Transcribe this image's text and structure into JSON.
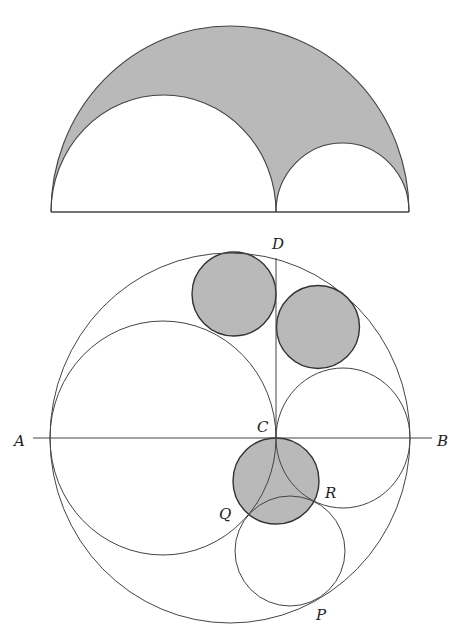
{
  "figure_top": {
    "title": "Arbelos",
    "shade_color": "#b9b9b9",
    "stroke_color": "#444444"
  },
  "figure_bottom": {
    "title": "Arbelos with Archimedean twin circles and Bankoff circle",
    "labels": {
      "A": "A",
      "B": "B",
      "C": "C",
      "D": "D",
      "P": "P",
      "Q": "Q",
      "R": "R"
    },
    "shade_color": "#b9b9b9",
    "stroke_color": "#444444"
  }
}
